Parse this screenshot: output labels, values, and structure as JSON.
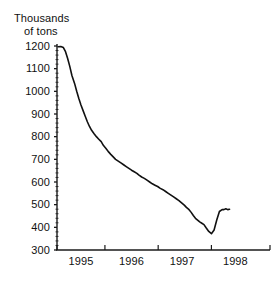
{
  "figure": {
    "axis_title_line1": "Thousands",
    "axis_title_line2": "of tons",
    "caption_clipped": ""
  },
  "colors": {
    "line": "#111111",
    "axis": "#1a1a1a",
    "text": "#111111",
    "background": "#ffffff"
  },
  "chart_data": {
    "type": "line",
    "title": "Thousands of tons",
    "xlabel": "",
    "ylabel": "Thousands of tons",
    "xlim": [
      1994.6,
      1998.6
    ],
    "ylim": [
      300,
      1200
    ],
    "grid": false,
    "legend": null,
    "y_ticks": [
      300,
      400,
      500,
      600,
      700,
      800,
      900,
      1000,
      1100,
      1200
    ],
    "y_tick_labels": [
      "300",
      "400",
      "500",
      "600",
      "700",
      "800",
      "900",
      "1000",
      "1100",
      "1200"
    ],
    "y_minor_tick_step": 20,
    "x_ticks": [
      1994.6,
      1995.5,
      1996.5,
      1997.5,
      1998.6
    ],
    "x_tick_labels": [
      "1995",
      "1996",
      "1997",
      "1998"
    ],
    "x_label_positions": [
      1995.05,
      1996.0,
      1996.95,
      1997.95
    ],
    "series": [
      {
        "name": "Stocks",
        "x": [
          1994.62,
          1994.67,
          1994.72,
          1994.76,
          1994.8,
          1994.84,
          1994.88,
          1994.93,
          1994.97,
          1995.01,
          1995.05,
          1995.09,
          1995.13,
          1995.17,
          1995.21,
          1995.25,
          1995.3,
          1995.34,
          1995.38,
          1995.43,
          1995.47,
          1995.52,
          1995.56,
          1995.61,
          1995.66,
          1995.7,
          1995.75,
          1995.8,
          1995.85,
          1995.9,
          1995.95,
          1996.0,
          1996.05,
          1996.1,
          1996.14,
          1996.19,
          1996.24,
          1996.29,
          1996.34,
          1996.39,
          1996.44,
          1996.49,
          1996.54,
          1996.59,
          1996.64,
          1996.69,
          1996.74,
          1996.79,
          1996.84,
          1996.89,
          1996.94,
          1996.99,
          1997.03,
          1997.08,
          1997.12,
          1997.16,
          1997.2,
          1997.24,
          1997.28,
          1997.32,
          1997.36,
          1997.4,
          1997.45,
          1997.5,
          1997.55,
          1997.6,
          1997.65,
          1997.7
        ],
        "values": [
          1197,
          1198,
          1193,
          1175,
          1145,
          1110,
          1070,
          1035,
          1000,
          968,
          940,
          915,
          890,
          866,
          845,
          828,
          812,
          800,
          790,
          778,
          762,
          748,
          735,
          722,
          710,
          700,
          692,
          684,
          676,
          668,
          660,
          652,
          645,
          638,
          630,
          622,
          616,
          608,
          600,
          592,
          586,
          580,
          572,
          566,
          558,
          550,
          542,
          534,
          526,
          518,
          508,
          498,
          488,
          478,
          466,
          452,
          440,
          432,
          424,
          418,
          412,
          398,
          382,
          372,
          388,
          432,
          470,
          478
        ],
        "end_values": [
          478,
          482,
          478,
          480
        ],
        "color": "#111111",
        "linewidth": 1.6,
        "marker": null
      }
    ],
    "annotations": []
  }
}
